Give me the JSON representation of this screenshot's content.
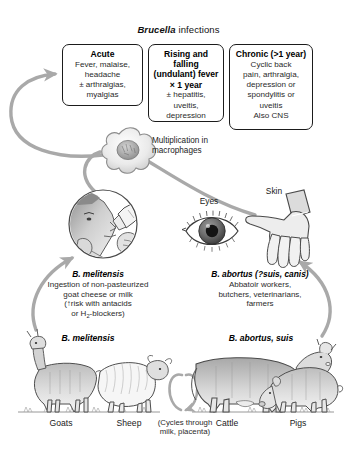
{
  "figure": {
    "title_species": "Brucella",
    "title_rest": " infections",
    "width": 357,
    "height": 450
  },
  "colors": {
    "arrow_gray": "#a9a9a9",
    "box_border": "#1b1b1b",
    "text_dark": "#111111",
    "text_body": "#2a2a2a",
    "artwork_fill": "#d6d6d6",
    "artwork_line": "#5a5a5a",
    "background": "#ffffff"
  },
  "clinical_boxes": [
    {
      "id": "acute",
      "heading": "Acute",
      "body": "Fever, malaise,\nheadache\n± arthralgias,\nmyalgias"
    },
    {
      "id": "undulant",
      "heading": "Rising and\nfalling (undulant)\nfever × 1 year",
      "body": "± hepatitis,\nuveitis,\ndepression"
    },
    {
      "id": "chronic",
      "heading": "Chronic (>1 year)",
      "body": "Cyclic back\npain, arthralgia,\ndepression or\nspondylitis or\nuveitis\nAlso CNS"
    }
  ],
  "labels": {
    "macrophage": "Multiplication in\nmacrophages",
    "eyes": "Eyes",
    "skin": "Skin"
  },
  "routes": [
    {
      "id": "melitensis",
      "species": "B. melitensis",
      "detail_line1": "Ingestion of non-pasteurized",
      "detail_line2": "goat cheese or milk",
      "detail_line3_pre": "(↑risk with antacids",
      "detail_line4_pre": "or H",
      "detail_line4_sub": "2",
      "detail_line4_post": "-blockers)"
    },
    {
      "id": "abortus",
      "species": "B. abortus (?suis, canis)",
      "detail": "Abbatoir workers,\nbutchers, veterinarians,\nfarmers"
    }
  ],
  "reservoirs": {
    "left_group_label": "B. melitensis",
    "right_group_label": "B. abortus, suis",
    "animals": [
      {
        "id": "goats",
        "label": "Goats"
      },
      {
        "id": "sheep",
        "label": "Sheep"
      },
      {
        "id": "cattle",
        "label": "Cattle"
      },
      {
        "id": "pigs",
        "label": "Pigs"
      }
    ],
    "cycle_note": "(Cycles through\nmilk, placenta)"
  },
  "illustrations": [
    {
      "id": "macrophage-cell",
      "name": "macrophage-icon"
    },
    {
      "id": "drinking-person",
      "name": "person-drinking-milk-illustration"
    },
    {
      "id": "eye",
      "name": "eye-illustration"
    },
    {
      "id": "hand",
      "name": "hand-illustration"
    },
    {
      "id": "goat",
      "name": "goat-illustration"
    },
    {
      "id": "sheep",
      "name": "sheep-illustration"
    },
    {
      "id": "cattle",
      "name": "cow-illustration"
    },
    {
      "id": "pig",
      "name": "pig-illustration"
    }
  ]
}
